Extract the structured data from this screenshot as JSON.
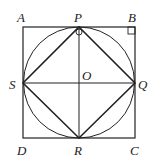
{
  "diagram": {
    "labels": {
      "A": "A",
      "P": "P",
      "B": "B",
      "S": "S",
      "O": "O",
      "Q": "Q",
      "D": "D",
      "R": "R",
      "C": "C"
    },
    "colors": {
      "stroke": "#222222",
      "background": "#ffffff"
    }
  }
}
